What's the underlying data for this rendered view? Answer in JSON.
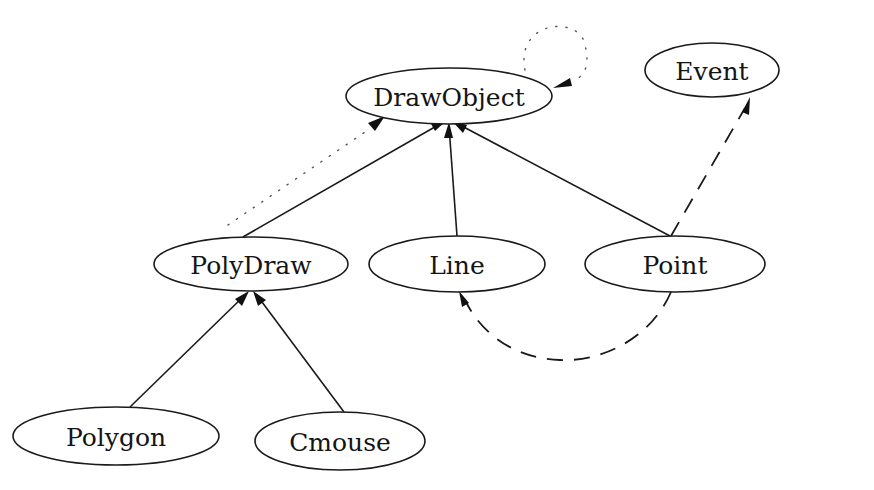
{
  "diagram": {
    "type": "class-hierarchy-graph",
    "nodes": [
      {
        "id": "drawobject",
        "label": "DrawObject",
        "cx": 449,
        "cy": 96,
        "rx": 103,
        "ry": 28
      },
      {
        "id": "event",
        "label": "Event",
        "cx": 712,
        "cy": 70,
        "rx": 67,
        "ry": 27
      },
      {
        "id": "polydraw",
        "label": "PolyDraw",
        "cx": 251,
        "cy": 264,
        "rx": 97,
        "ry": 27
      },
      {
        "id": "line",
        "label": "Line",
        "cx": 457,
        "cy": 264,
        "rx": 88,
        "ry": 28
      },
      {
        "id": "point",
        "label": "Point",
        "cx": 675,
        "cy": 264,
        "rx": 90,
        "ry": 28
      },
      {
        "id": "polygon",
        "label": "Polygon",
        "cx": 116,
        "cy": 436,
        "rx": 103,
        "ry": 29
      },
      {
        "id": "cmouse",
        "label": "Cmouse",
        "cx": 340,
        "cy": 441,
        "rx": 85,
        "ry": 29
      }
    ],
    "edges": [
      {
        "from": "polydraw",
        "to": "drawobject",
        "style": "solid",
        "meaning": "inherits"
      },
      {
        "from": "line",
        "to": "drawobject",
        "style": "solid",
        "meaning": "inherits"
      },
      {
        "from": "point",
        "to": "drawobject",
        "style": "solid",
        "meaning": "inherits"
      },
      {
        "from": "polygon",
        "to": "polydraw",
        "style": "solid",
        "meaning": "inherits"
      },
      {
        "from": "cmouse",
        "to": "polydraw",
        "style": "solid",
        "meaning": "inherits"
      },
      {
        "from": "polydraw",
        "to": "drawobject",
        "style": "dotted"
      },
      {
        "from": "drawobject",
        "to": "drawobject",
        "style": "dotted",
        "meaning": "self-loop"
      },
      {
        "from": "point",
        "to": "event",
        "style": "dashed"
      },
      {
        "from": "point",
        "to": "line",
        "style": "dashed"
      }
    ]
  }
}
